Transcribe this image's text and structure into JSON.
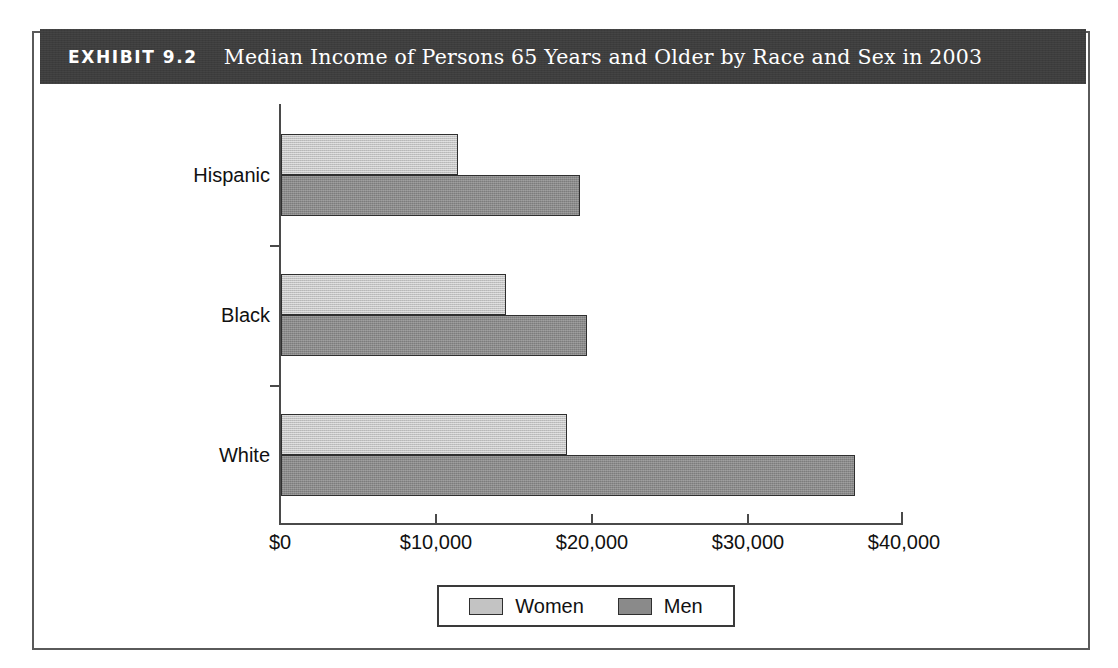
{
  "header": {
    "label": "EXHIBIT 9.2",
    "title": "Median Income of Persons 65 Years and Older by Race and Sex in 2003"
  },
  "legend": {
    "items": [
      {
        "label": "Women",
        "color": "#c3c3c3"
      },
      {
        "label": "Men",
        "color": "#8a8a8a"
      }
    ]
  },
  "axis": {
    "x_ticks": [
      "$0",
      "$10,000",
      "$20,000",
      "$30,000",
      "$40,000"
    ],
    "categories": [
      "Hispanic",
      "Black",
      "White"
    ]
  },
  "chart_data": {
    "type": "bar",
    "orientation": "horizontal",
    "title": "Median Income of Persons 65 Years and Older by Race and Sex in 2003",
    "xlabel": "",
    "ylabel": "",
    "categories": [
      "Hispanic",
      "Black",
      "White"
    ],
    "series": [
      {
        "name": "Women",
        "color": "#c3c3c3",
        "values": [
          11400,
          14500,
          18400
        ]
      },
      {
        "name": "Men",
        "color": "#8a8a8a",
        "values": [
          19200,
          19700,
          36900
        ]
      }
    ],
    "xlim": [
      0,
      40000
    ],
    "xtick_values": [
      0,
      10000,
      20000,
      30000,
      40000
    ],
    "xtick_labels": [
      "$0",
      "$10,000",
      "$20,000",
      "$30,000",
      "$40,000"
    ],
    "grid": false,
    "legend_position": "bottom-center"
  }
}
